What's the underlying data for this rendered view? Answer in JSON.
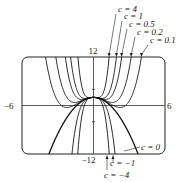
{
  "chart_data": {
    "type": "line",
    "title": "",
    "xlabel": "",
    "ylabel": "",
    "xlim": [
      -6,
      6
    ],
    "ylim": [
      -12,
      12
    ],
    "tick_labels": {
      "x_min": "-6",
      "x_max": "6",
      "y_max": "12",
      "y_min": "-12"
    },
    "grid": false,
    "function_family": "y = c x^4 - x^2 + 2",
    "series": [
      {
        "name": "c = 4",
        "c": 4
      },
      {
        "name": "c = 1",
        "c": 1
      },
      {
        "name": "c = 0.5",
        "c": 0.5
      },
      {
        "name": "c = 0.2",
        "c": 0.2
      },
      {
        "name": "c = 0.1",
        "c": 0.1
      },
      {
        "name": "c = 0",
        "c": 0
      },
      {
        "name": "c = -1",
        "c": -1
      },
      {
        "name": "c = -4",
        "c": -4
      }
    ],
    "annotations": [
      "c = 4",
      "c = 1",
      "c = 0.5",
      "c = 0.2",
      "c = 0.1",
      "c = 0",
      "c = -1",
      "c = -4"
    ]
  }
}
